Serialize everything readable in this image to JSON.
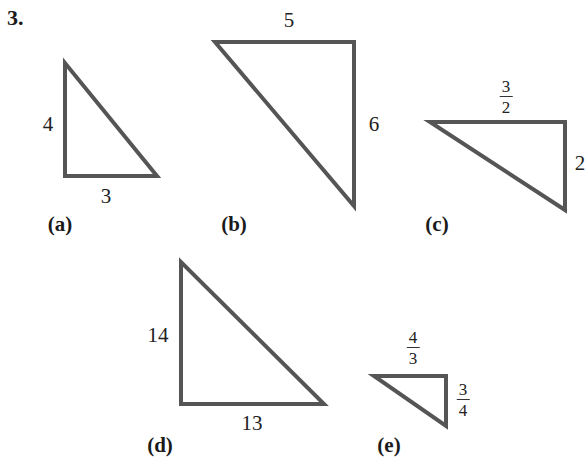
{
  "problem": {
    "number": "3."
  },
  "style": {
    "stroke_color": "#555555",
    "stroke_width": 4
  },
  "triangles": [
    {
      "part": "(a)",
      "vertices": [
        [
          65,
          63
        ],
        [
          65,
          176
        ],
        [
          157,
          176
        ]
      ],
      "labels": [
        {
          "text": "4",
          "x": 48,
          "y": 124
        },
        {
          "text": "3",
          "x": 106,
          "y": 196
        }
      ],
      "part_pos": {
        "x": 60,
        "y": 224
      }
    },
    {
      "part": "(b)",
      "vertices": [
        [
          215,
          42
        ],
        [
          354,
          42
        ],
        [
          354,
          206
        ]
      ],
      "labels": [
        {
          "text": "5",
          "x": 289,
          "y": 20
        },
        {
          "text": "6",
          "x": 374,
          "y": 124
        }
      ],
      "part_pos": {
        "x": 234,
        "y": 224
      }
    },
    {
      "part": "(c)",
      "vertices": [
        [
          430,
          122
        ],
        [
          565,
          122
        ],
        [
          565,
          210
        ]
      ],
      "labels": [
        {
          "text": "2",
          "x": 580,
          "y": 163
        }
      ],
      "fractions": [
        {
          "num": "3",
          "den": "2",
          "x": 506,
          "y": 97
        }
      ],
      "part_pos": {
        "x": 437,
        "y": 224
      }
    },
    {
      "part": "(d)",
      "vertices": [
        [
          181,
          262
        ],
        [
          181,
          404
        ],
        [
          324,
          404
        ]
      ],
      "labels": [
        {
          "text": "14",
          "x": 158,
          "y": 335
        },
        {
          "text": "13",
          "x": 252,
          "y": 423
        }
      ],
      "part_pos": {
        "x": 160,
        "y": 445
      }
    },
    {
      "part": "(e)",
      "vertices": [
        [
          374,
          376
        ],
        [
          446,
          376
        ],
        [
          446,
          426
        ]
      ],
      "fractions": [
        {
          "num": "4",
          "den": "3",
          "x": 413,
          "y": 348
        },
        {
          "num": "3",
          "den": "4",
          "x": 463,
          "y": 400
        }
      ],
      "part_pos": {
        "x": 389,
        "y": 445
      }
    }
  ]
}
